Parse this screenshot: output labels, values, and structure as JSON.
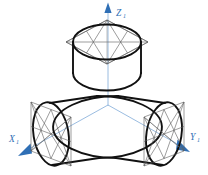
{
  "figure": {
    "background_color": "#ffffff",
    "outline_color": "#111111",
    "construction_color": "#5a5a5a",
    "axis_color": "#8fb4dd",
    "axis_label_color": "#2f6fb5"
  },
  "axes": {
    "origin": {
      "x": 108,
      "y": 104
    },
    "items": [
      {
        "name": "z-axis",
        "label_main": "Z",
        "label_sub": "1",
        "label_x": 117,
        "label_y": 14,
        "direction": "up",
        "line": {
          "x1": 108,
          "y1": 104,
          "x2": 108,
          "y2": 12
        },
        "arrow": "112,12 108,2 104,12"
      },
      {
        "name": "x-axis",
        "label_main": "X",
        "label_sub": "1",
        "label_x": 10,
        "label_y": 140,
        "direction": "down-left",
        "line": {
          "x1": 108,
          "y1": 104,
          "x2": 26,
          "y2": 151
        },
        "arrow": "28,144 18,156 31,155"
      },
      {
        "name": "y-axis",
        "label_main": "Y",
        "label_sub": "1",
        "label_x": 188,
        "label_y": 140,
        "direction": "down-right",
        "line": {
          "x1": 108,
          "y1": 104,
          "x2": 182,
          "y2": 147
        },
        "arrow": "180,140 190,152 177,151"
      }
    ]
  },
  "cylinders": [
    {
      "name": "top-cylinder",
      "axis": "Z1",
      "description": "Vertical cylinder with top circular face shown as ellipse inscribed in isometric rhombus",
      "face_center": {
        "x": 107,
        "y": 42
      },
      "face_rhombus": "107,20 148,42 107,65 67,42",
      "ellipse_rx": 35,
      "ellipse_ry": 18,
      "body_height": 40
    },
    {
      "name": "left-cylinder",
      "axis": "X1",
      "description": "Cylinder along X1 axis with front circular face shown as ellipse inscribed in isometric rhombus",
      "face_center": {
        "x": 50,
        "y": 135
      },
      "face_rhombus": "30,102 71,118 70,160 30,144",
      "ellipse_rx": 18,
      "ellipse_ry": 35,
      "body_length": 45
    },
    {
      "name": "right-cylinder",
      "axis": "Y1",
      "description": "Cylinder along Y1 axis with front circular face shown as ellipse inscribed in isometric rhombus",
      "face_center": {
        "x": 165,
        "y": 135
      },
      "face_rhombus": "185,102 145,118 146,160 185,144",
      "ellipse_rx": 18,
      "ellipse_ry": 35,
      "body_length": 45
    }
  ],
  "construction": {
    "method": "four-center ellipse approximation",
    "elements": [
      "circumscribing rhombus",
      "rhombus diagonals",
      "arc centre radii",
      "mid-span chords"
    ]
  }
}
